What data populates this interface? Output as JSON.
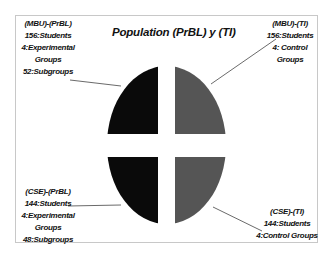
{
  "title": "Population (PrBL) y (TI)",
  "colors": {
    "experimental": "#0a0a0a",
    "control": "#555555",
    "frame_border": "#c8c8c8",
    "leader_line": "#444444",
    "text": "#111111"
  },
  "quadrants": {
    "top_left": {
      "group": "(MBU)-(PrBL)",
      "lines": [
        "(MBU)-(PrBL)",
        "156:Students",
        "4:Experimental",
        "Groups",
        "52:Subgroups"
      ]
    },
    "top_right": {
      "group": "(MBU)-(TI)",
      "lines": [
        "(MBU)-(TI)",
        "156:Students",
        "4: Control",
        "Groups"
      ]
    },
    "bottom_left": {
      "group": "(CSE)-(PrBL)",
      "lines": [
        "(CSE)-(PrBL)",
        "144:Students",
        "4:Experimental",
        "Groups",
        "48:Subgroups"
      ]
    },
    "bottom_right": {
      "group": "(CSE)-(TI)",
      "lines": [
        "(CSE)-(TI)",
        "144:Students",
        "4:Control Groups"
      ]
    }
  }
}
